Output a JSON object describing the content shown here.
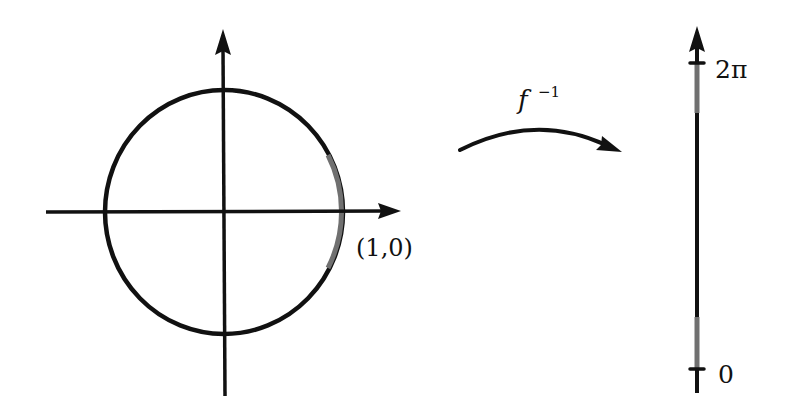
{
  "diagram": {
    "colors": {
      "stroke": "#111111",
      "highlight": "#707070",
      "background": "#ffffff"
    },
    "circle_panel": {
      "point_label": "(1,0)"
    },
    "map_arrow": {
      "label_base": "f",
      "label_superscript": "−1"
    },
    "interval_panel": {
      "top_label": "2π",
      "bottom_label": "0"
    }
  }
}
